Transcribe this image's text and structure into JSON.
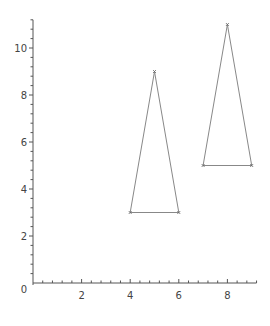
{
  "chart_data": {
    "type": "line",
    "title": "",
    "xlabel": "",
    "ylabel": "",
    "xlim": [
      0,
      9.2
    ],
    "ylim": [
      0,
      11.2
    ],
    "grid": false,
    "legend": null,
    "x_ticks": [
      "2",
      "4",
      "6",
      "8"
    ],
    "y_ticks": [
      "0",
      "2",
      "4",
      "6",
      "8",
      "10"
    ],
    "series": [
      {
        "name": "triangle-1",
        "closed": true,
        "x": [
          4,
          6,
          5,
          4
        ],
        "y": [
          3,
          3,
          9,
          3
        ]
      },
      {
        "name": "triangle-2",
        "closed": true,
        "x": [
          7,
          9,
          8,
          7
        ],
        "y": [
          5,
          5,
          11,
          5
        ]
      }
    ],
    "colors": {
      "axis": "#555555",
      "line": "#888888",
      "marker": "#666666"
    }
  }
}
